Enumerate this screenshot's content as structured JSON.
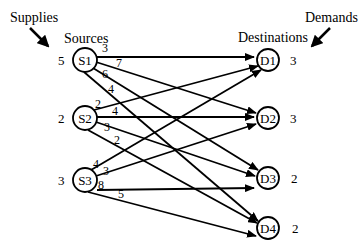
{
  "labels": {
    "supplies": "Supplies",
    "demands": "Demands",
    "sources": "Sources",
    "destinations": "Destinations"
  },
  "sources": [
    {
      "id": "S1",
      "label": "S1",
      "supply": "5"
    },
    {
      "id": "S2",
      "label": "S2",
      "supply": "2"
    },
    {
      "id": "S3",
      "label": "S3",
      "supply": "3"
    }
  ],
  "destinations": [
    {
      "id": "D1",
      "label": "D1",
      "demand": "3"
    },
    {
      "id": "D2",
      "label": "D2",
      "demand": "3"
    },
    {
      "id": "D3",
      "label": "D3",
      "demand": "2"
    },
    {
      "id": "D4",
      "label": "D4",
      "demand": "2"
    }
  ],
  "edges": [
    {
      "from": "S1",
      "to": "D1",
      "cost": "3"
    },
    {
      "from": "S1",
      "to": "D2",
      "cost": "7"
    },
    {
      "from": "S1",
      "to": "D3",
      "cost": "6"
    },
    {
      "from": "S1",
      "to": "D4",
      "cost": "4"
    },
    {
      "from": "S2",
      "to": "D1",
      "cost": "2"
    },
    {
      "from": "S2",
      "to": "D2",
      "cost": "4"
    },
    {
      "from": "S2",
      "to": "D3",
      "cost": "3"
    },
    {
      "from": "S2",
      "to": "D4",
      "cost": "2"
    },
    {
      "from": "S3",
      "to": "D1",
      "cost": "4"
    },
    {
      "from": "S3",
      "to": "D2",
      "cost": "3"
    },
    {
      "from": "S3",
      "to": "D3",
      "cost": "8"
    },
    {
      "from": "S3",
      "to": "D4",
      "cost": "5"
    }
  ]
}
